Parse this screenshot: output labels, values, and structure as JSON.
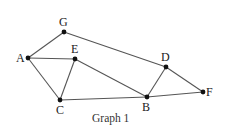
{
  "diagram": {
    "type": "undirected-graph",
    "caption": "Graph 1",
    "nodes": [
      {
        "id": "A",
        "label": "A",
        "x": 28,
        "y": 58,
        "lx": 16,
        "ly": 62
      },
      {
        "id": "G",
        "label": "G",
        "x": 64,
        "y": 32,
        "lx": 59,
        "ly": 26
      },
      {
        "id": "E",
        "label": "E",
        "x": 75,
        "y": 59,
        "lx": 71,
        "ly": 53
      },
      {
        "id": "C",
        "label": "C",
        "x": 60,
        "y": 100,
        "lx": 56,
        "ly": 114
      },
      {
        "id": "D",
        "label": "D",
        "x": 166,
        "y": 67,
        "lx": 161,
        "ly": 61
      },
      {
        "id": "B",
        "label": "B",
        "x": 147,
        "y": 97,
        "lx": 142,
        "ly": 111
      },
      {
        "id": "F",
        "label": "F",
        "x": 203,
        "y": 92,
        "lx": 206,
        "ly": 96
      }
    ],
    "edges": [
      {
        "from": "A",
        "to": "G"
      },
      {
        "from": "A",
        "to": "E"
      },
      {
        "from": "A",
        "to": "C"
      },
      {
        "from": "E",
        "to": "C"
      },
      {
        "from": "E",
        "to": "B"
      },
      {
        "from": "G",
        "to": "D"
      },
      {
        "from": "D",
        "to": "B"
      },
      {
        "from": "D",
        "to": "F"
      },
      {
        "from": "C",
        "to": "B"
      },
      {
        "from": "B",
        "to": "F"
      }
    ],
    "colors": {
      "edge": "#555555",
      "node": "#111111",
      "label": "#222222",
      "background": "#ffffff"
    }
  }
}
